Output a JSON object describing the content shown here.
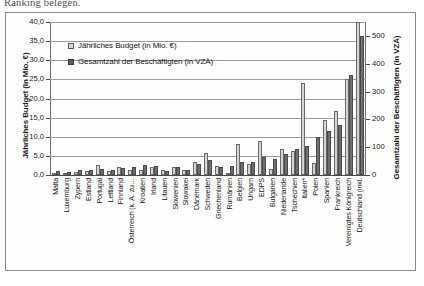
{
  "page": {
    "top_fragment_text": "Ranking belegen."
  },
  "legend": {
    "items": [
      {
        "label": "Jährliches Budget (in Mio. €)",
        "swatch": "budget",
        "color": "#d8d8d8"
      },
      {
        "label": "Gesamtzahl der Beschäftigten (in VZÄ)",
        "swatch": "staff",
        "color": "#5e5e5e"
      }
    ]
  },
  "chart_data": {
    "type": "bar",
    "title": "",
    "subtitle": "",
    "xlabel": "",
    "ylabel": "Jährliches Budget (in Mio. €)",
    "y2label": "Gesamtzahl der Beschäftigten (in VZÄ)",
    "ylim": [
      0,
      40
    ],
    "y2lim": [
      0,
      550
    ],
    "yticks": [
      "0,0",
      "5,0",
      "10,0",
      "15,0",
      "20,0",
      "25,0",
      "30,0",
      "35,0",
      "40,0"
    ],
    "ytick_values": [
      0,
      5,
      10,
      15,
      20,
      25,
      30,
      35,
      40
    ],
    "y2ticks": [
      "0",
      "100",
      "200",
      "300",
      "400",
      "500"
    ],
    "y2tick_values": [
      0,
      100,
      200,
      300,
      400,
      500
    ],
    "grid": true,
    "legend_position": "upper-left-inside",
    "categories": [
      "Malta",
      "Luxemburg",
      "Zypern",
      "Estland",
      "Portugal",
      "Lettland",
      "Finnland",
      "Österreich (k. A. zu…",
      "Kroatien",
      "Irland",
      "Litauen",
      "Slowenien",
      "Slowakei",
      "Dänemark",
      "Schweden",
      "Griechenland",
      "Rumänien",
      "Belgien",
      "Ungarn",
      "EDPS",
      "Bulgarien",
      "Niederlande",
      "Tschechien",
      "Italien*",
      "Polen",
      "Spanien",
      "Frankreich",
      "Vereinigtes Königreich",
      "Deutschland (inkl."
    ],
    "series": [
      {
        "name": "Jährliches Budget (in Mio. €)",
        "axis": "left",
        "unit": "Mio. €",
        "color": "#d3d3d3",
        "values": [
          0.4,
          0.6,
          0.9,
          1.1,
          2.6,
          1.1,
          2.1,
          1.3,
          1.2,
          2.2,
          1.2,
          2.1,
          1.4,
          3.5,
          5.8,
          2.3,
          0.5,
          8.0,
          2.9,
          9.0,
          1.6,
          6.9,
          6.4,
          24.0,
          3.1,
          14.3,
          16.8,
          25.1,
          40.0
        ]
      },
      {
        "name": "Gesamtzahl der Beschäftigten (in VZÄ)",
        "axis": "right",
        "unit": "VZÄ",
        "color": "#6e6e6e",
        "values": [
          13,
          11,
          19,
          17,
          22,
          17,
          25,
          28,
          35,
          32,
          15,
          28,
          19,
          41,
          54,
          28,
          32,
          47,
          47,
          65,
          58,
          74,
          94,
          104,
          138,
          158,
          180,
          360,
          500
        ]
      }
    ]
  }
}
